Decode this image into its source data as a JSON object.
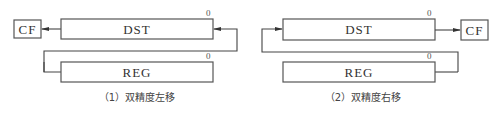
{
  "diagrams": [
    {
      "id": "left-shift",
      "caption": "（1）双精度左移",
      "dst_label": "DST",
      "reg_label": "REG",
      "cf_label": "CF",
      "dst_bit_label": "0",
      "reg_bit_label": "0"
    },
    {
      "id": "right-shift",
      "caption": "（2）双精度右移",
      "dst_label": "DST",
      "reg_label": "REG",
      "cf_label": "CF",
      "dst_bit_label": "0",
      "reg_bit_label": "0"
    }
  ],
  "colors": {
    "stroke": "#555555",
    "text": "#333333",
    "background": "#ffffff"
  }
}
